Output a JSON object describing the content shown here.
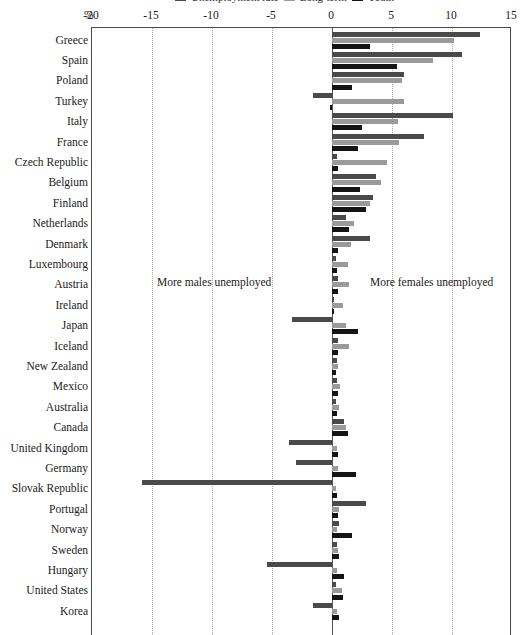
{
  "legend": {
    "entries": [
      {
        "label": "Unemployment rate",
        "color": "#4a4a4a"
      },
      {
        "label": "Long-term",
        "color": "#9a9a9a"
      },
      {
        "label": "Youth",
        "color": "#141414"
      }
    ]
  },
  "axis": {
    "unit_label": "%",
    "tick_labels": [
      "-20",
      "-15",
      "-10",
      "-5",
      "0",
      "5",
      "10",
      "15"
    ]
  },
  "annotations": {
    "left": "More males unemployed",
    "right": "More females unemployed"
  },
  "chart_data": {
    "type": "bar",
    "orientation": "horizontal",
    "title": "",
    "xlabel": "%",
    "ylabel": "",
    "xlim": [
      -20,
      15
    ],
    "xticks": [
      -20,
      -15,
      -10,
      -5,
      0,
      5,
      10,
      15
    ],
    "grid": "vertical-dotted",
    "legend_position": "top",
    "categories": [
      "Greece",
      "Spain",
      "Poland",
      "Turkey",
      "Italy",
      "France",
      "Czech Republic",
      "Belgium",
      "Finland",
      "Netherlands",
      "Denmark",
      "Luxembourg",
      "Austria",
      "Ireland",
      "Japan",
      "Iceland",
      "New Zealand",
      "Mexico",
      "Australia",
      "Canada",
      "United Kingdom",
      "Germany",
      "Slovak Republic",
      "Portugal",
      "Norway",
      "Sweden",
      "Hungary",
      "United States",
      "Korea"
    ],
    "series": [
      {
        "name": "Unemployment rate",
        "color": "#4a4a4a",
        "values": [
          12.3,
          10.8,
          6.0,
          -1.6,
          10.1,
          7.7,
          0.4,
          3.7,
          3.4,
          1.2,
          3.2,
          0.3,
          0.5,
          0.2,
          -3.3,
          0.5,
          0.4,
          0.4,
          0.3,
          1.0,
          -3.6,
          -3.0,
          -15.8,
          2.8,
          0.6,
          0.4,
          -5.4,
          0.3,
          -1.6
        ]
      },
      {
        "name": "Long-term",
        "color": "#9a9a9a",
        "values": [
          10.2,
          8.4,
          5.8,
          6.0,
          5.5,
          5.6,
          4.6,
          4.1,
          3.2,
          1.8,
          1.6,
          1.3,
          1.4,
          0.9,
          1.2,
          1.4,
          0.5,
          0.7,
          0.6,
          1.2,
          0.4,
          0.5,
          0.3,
          0.6,
          0.4,
          0.5,
          0.4,
          0.8,
          0.4
        ]
      },
      {
        "name": "Youth",
        "color": "#141414",
        "values": [
          3.2,
          5.4,
          1.7,
          -0.2,
          2.5,
          2.2,
          0.5,
          2.3,
          2.8,
          1.4,
          0.5,
          0.4,
          0.5,
          0.1,
          2.2,
          0.5,
          0.3,
          0.5,
          0.4,
          1.3,
          0.5,
          2.0,
          0.4,
          0.5,
          1.7,
          0.6,
          1.0,
          0.9,
          0.6
        ]
      }
    ]
  }
}
